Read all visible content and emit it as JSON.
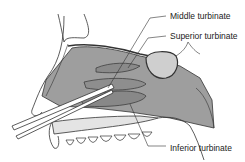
{
  "figure": {
    "colors": {
      "line": "#333333",
      "tissue_fill": "#9a9a9a",
      "light_fill": "#d4d4d4",
      "background": "#ffffff"
    }
  },
  "labels": {
    "middle_turbinate": "Middle turbinate",
    "superior_turbinate": "Superior turbinate",
    "inferior_turbinate": "Inferior turbinate"
  }
}
